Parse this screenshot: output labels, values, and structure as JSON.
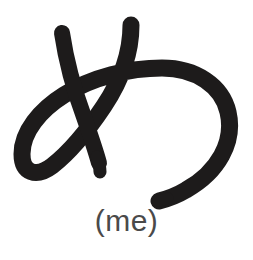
{
  "card": {
    "background_color": "#ffffff",
    "ink_color": "#1d1b1b",
    "romaji_color": "#4a4a4a"
  },
  "glyph": {
    "character": "め",
    "script": "hiragana",
    "name": "hiragana-me-glyph",
    "stroke_count": 2,
    "strokes": [
      {
        "index": 1,
        "name": "diagonal-downstroke",
        "description": "short diagonal stroke from upper-left slanting down to the right"
      },
      {
        "index": 2,
        "name": "looping-curve-stroke",
        "description": "long stroke starting upper-middle, sweeping left into a loop, crossing itself and curving right into a large open hook"
      }
    ]
  },
  "romaji": {
    "label": "(me)",
    "reading": "me"
  }
}
